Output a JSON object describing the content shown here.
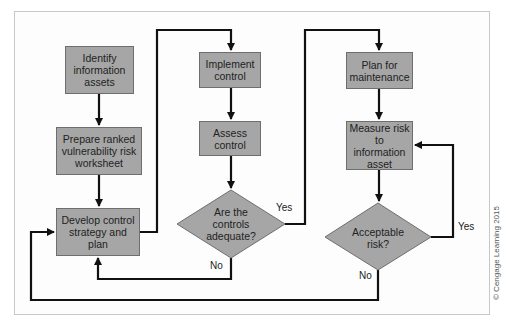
{
  "diagram": {
    "type": "flowchart",
    "colors": {
      "node_fill": "#a6a6a6",
      "node_border": "#6e6e6e",
      "edge": "#111111",
      "frame": "#c8c8c8"
    },
    "nodes": {
      "identify": "Identify information assets",
      "prepare": "Prepare ranked vulnerability risk worksheet",
      "develop": "Develop control strategy and plan",
      "implement": "Implement control",
      "assess": "Assess control",
      "adequate": "Are the controls adequate?",
      "plan_maint": "Plan for maintenance",
      "measure": "Measure risk to information asset",
      "acceptable": "Acceptable risk?"
    },
    "edge_labels": {
      "adequate_yes": "Yes",
      "adequate_no": "No",
      "acceptable_yes": "Yes",
      "acceptable_no": "No"
    },
    "edges": [
      [
        "identify",
        "prepare"
      ],
      [
        "prepare",
        "develop"
      ],
      [
        "develop",
        "implement"
      ],
      [
        "implement",
        "assess"
      ],
      [
        "assess",
        "adequate"
      ],
      [
        "adequate",
        "plan_maint",
        "Yes"
      ],
      [
        "adequate",
        "develop",
        "No"
      ],
      [
        "plan_maint",
        "measure"
      ],
      [
        "measure",
        "acceptable"
      ],
      [
        "acceptable",
        "measure",
        "Yes"
      ],
      [
        "acceptable",
        "develop",
        "No"
      ]
    ]
  },
  "credit": "© Cengage Learning 2015"
}
